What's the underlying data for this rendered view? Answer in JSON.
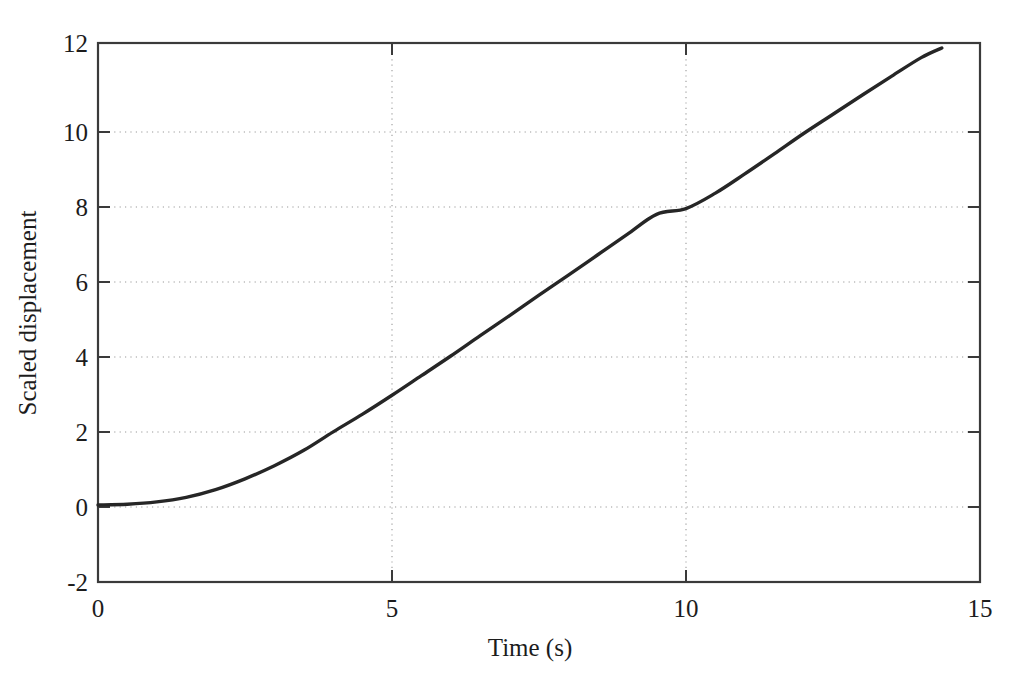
{
  "figure": {
    "background_color": "#ffffff",
    "axis_color": "#3a3a3a",
    "grid_color": "#9a9a9a",
    "curve_color": "#262626"
  },
  "axes": {
    "x_title": "Time (s)",
    "y_title": "Scaled displacement",
    "x_ticks": [
      "0",
      "5",
      "10",
      "15"
    ],
    "y_ticks": [
      "12",
      "10",
      "8",
      "6",
      "4",
      "2",
      "0",
      "-2"
    ]
  },
  "chart_data": {
    "type": "line",
    "title": "",
    "xlabel": "Time (s)",
    "ylabel": "Scaled displacement",
    "xlim": [
      0,
      15
    ],
    "ylim": [
      -2,
      12
    ],
    "xticks": [
      0,
      5,
      10,
      15
    ],
    "yticks": [
      -2,
      0,
      2,
      4,
      6,
      8,
      10,
      12
    ],
    "grid": true,
    "legend": "none",
    "series": [
      {
        "name": "Scaled displacement",
        "x": [
          0.0,
          0.5,
          1.0,
          1.5,
          2.0,
          2.5,
          3.0,
          3.5,
          4.0,
          4.5,
          5.0,
          5.5,
          6.0,
          6.5,
          7.0,
          7.5,
          8.0,
          8.5,
          9.0,
          9.5,
          10.0,
          10.5,
          11.0,
          11.5,
          12.0,
          12.5,
          13.0,
          13.5,
          14.0,
          14.35
        ],
        "y": [
          0.0,
          0.02,
          0.08,
          0.2,
          0.4,
          0.68,
          1.02,
          1.42,
          1.9,
          2.36,
          2.85,
          3.36,
          3.87,
          4.4,
          4.92,
          5.45,
          5.97,
          6.5,
          7.03,
          7.55,
          7.7,
          8.1,
          8.6,
          9.12,
          9.65,
          10.15,
          10.65,
          11.14,
          11.62,
          11.87
        ]
      }
    ],
    "annotations": []
  }
}
